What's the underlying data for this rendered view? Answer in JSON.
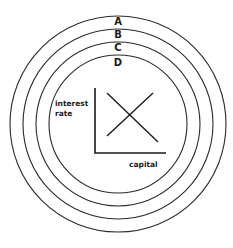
{
  "diagram": {
    "rings": [
      {
        "label": "A",
        "r": 108
      },
      {
        "label": "B",
        "r": 95
      },
      {
        "label": "C",
        "r": 82
      },
      {
        "label": "D",
        "r": 69
      }
    ],
    "center": {
      "x": 118,
      "y": 124
    },
    "graph": {
      "y_axis_label_line1": "interest",
      "y_axis_label_line2": "rate",
      "x_axis_label": "capital"
    },
    "colors": {
      "stroke": "#2a2a2a",
      "background": "#ffffff"
    }
  }
}
